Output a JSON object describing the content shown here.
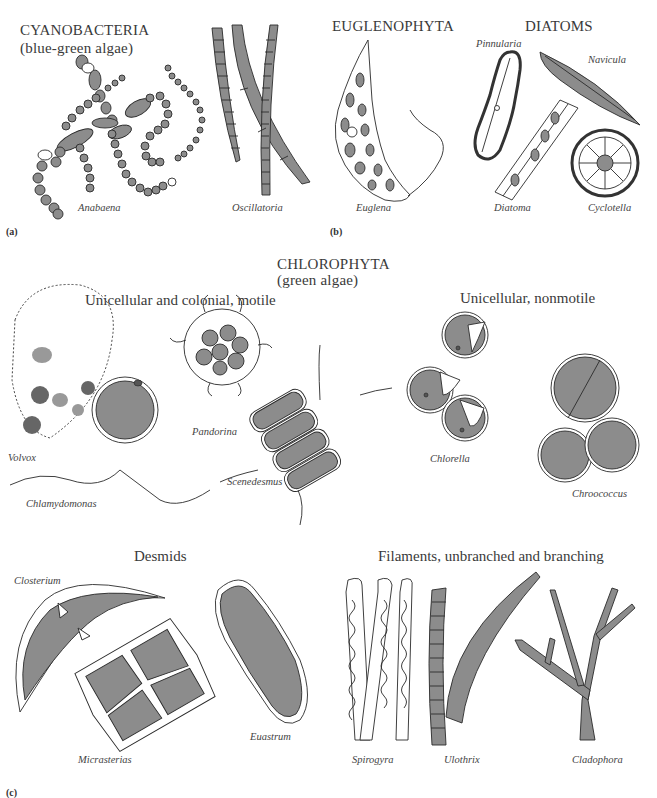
{
  "sections": {
    "cyanobacteria": {
      "title": "CYANOBACTERIA",
      "subtitle": "(blue-green algae)",
      "panel": "(a)",
      "organisms": [
        "Anabaena",
        "Oscillatoria"
      ]
    },
    "euglenophyta": {
      "title": "EUGLENOPHYTA",
      "panel": "(b)",
      "organisms": [
        "Euglena"
      ]
    },
    "diatoms": {
      "title": "DIATOMS",
      "organisms": [
        "Pinnularia",
        "Navicula",
        "Diatoma",
        "Cyclotella"
      ]
    },
    "chlorophyta": {
      "title": "CHLOROPHYTA",
      "subtitle": "(green algae)",
      "panel": "(c)",
      "groups": [
        {
          "title": "Unicellular and colonial, motile",
          "organisms": [
            "Volvox",
            "Pandorina",
            "Chlamydomonas",
            "Scenedesmus"
          ]
        },
        {
          "title": "Unicellular, nonmotile",
          "organisms": [
            "Chlorella",
            "Chroococcus"
          ]
        },
        {
          "title": "Desmids",
          "organisms": [
            "Closterium",
            "Micrasterias",
            "Euastrum"
          ]
        },
        {
          "title": "Filaments, unbranched and branching",
          "organisms": [
            "Spirogyra",
            "Ulothrix",
            "Cladophora"
          ]
        }
      ]
    }
  },
  "colors": {
    "fill": "#8a8a8a",
    "stroke": "#2a2a2a",
    "background": "#ffffff"
  }
}
